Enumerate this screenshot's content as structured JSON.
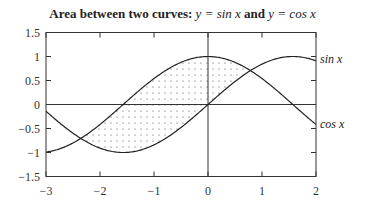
{
  "chart_data": {
    "type": "line",
    "title": "Area between two curves: y = sin x and y = cos x",
    "title_parts": {
      "prefix": "Area between two curves: ",
      "eq1": "y = sin x",
      "mid": " and ",
      "eq2": "y = cos x"
    },
    "xlabel": "",
    "ylabel": "",
    "xlim": [
      -3,
      2
    ],
    "ylim": [
      -1.5,
      1.5
    ],
    "xticks": [
      "−3",
      "−2",
      "−1",
      "0",
      "1",
      "2"
    ],
    "yticks": [
      "1.5",
      "1",
      "0.5",
      "0",
      "−0.5",
      "−1",
      "−1.5"
    ],
    "grid": false,
    "series": [
      {
        "name": "sin x",
        "function": "sin(x)",
        "label": "sin x"
      },
      {
        "name": "cos x",
        "function": "cos(x)",
        "label": "cos x"
      }
    ],
    "shaded_region": {
      "between": [
        "sin x",
        "cos x"
      ],
      "x_from": -2.356,
      "x_to": 0.785,
      "pattern": "dots"
    },
    "reference_lines": [
      "y = 0",
      "x = 0"
    ]
  }
}
